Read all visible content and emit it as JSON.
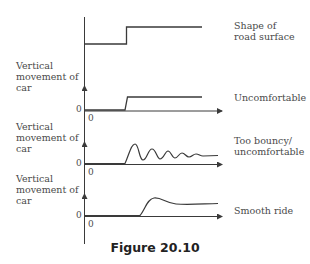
{
  "diagram": {
    "caption": "Figure 20.10",
    "colors": {
      "line": "#3a3a3a",
      "text": "#4a4a4a",
      "background": "#ffffff"
    },
    "rows": [
      {
        "id": "road",
        "y_label": [],
        "right_label": [
          "Shape of",
          "road surface"
        ],
        "curve": "step"
      },
      {
        "id": "uncomfortable",
        "y_label": [
          "Vertical",
          "movement of",
          "car"
        ],
        "origin_y": "0",
        "origin_x": "0",
        "right_label": [
          "Uncomfortable"
        ],
        "curve": "step-response"
      },
      {
        "id": "bouncy",
        "y_label": [
          "Vertical",
          "movement of",
          "car"
        ],
        "origin_y": "0",
        "origin_x": "0",
        "right_label": [
          "Too bouncy/",
          "uncomfortable"
        ],
        "curve": "damped-oscillation"
      },
      {
        "id": "smooth",
        "y_label": [
          "Vertical",
          "movement of",
          "car"
        ],
        "origin_y": "0",
        "origin_x": "0",
        "right_label": [
          "Smooth ride"
        ],
        "curve": "smooth-rise"
      }
    ]
  }
}
